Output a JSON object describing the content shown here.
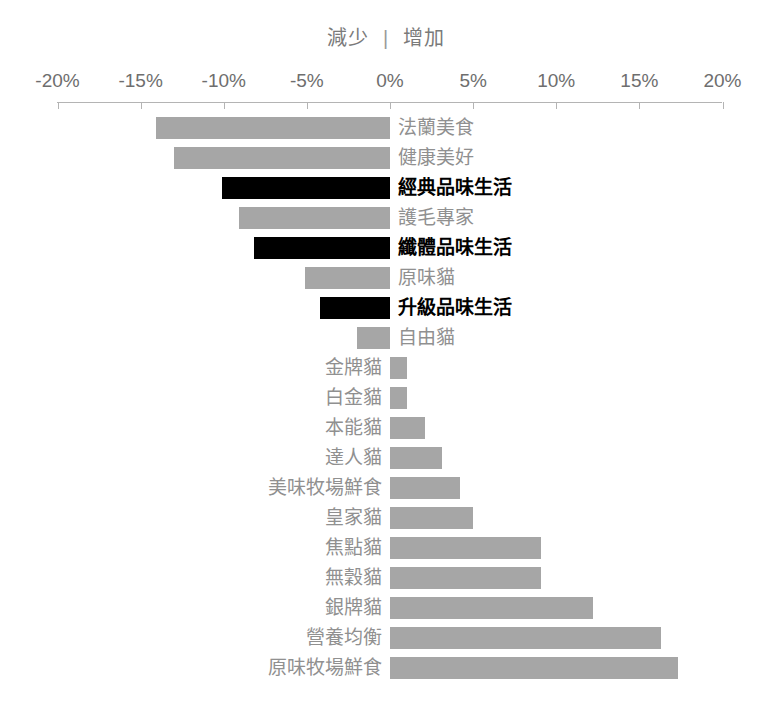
{
  "header": {
    "decrease_label": "減少",
    "separator": "|",
    "increase_label": "增加"
  },
  "axis": {
    "ticks": [
      "-20%",
      "-15%",
      "-10%",
      "-5%",
      "0%",
      "5%",
      "10%",
      "15%",
      "20%"
    ],
    "tick_values": [
      -20,
      -15,
      -10,
      -5,
      0,
      5,
      10,
      15,
      20
    ],
    "min": -20,
    "max": 20,
    "left_px": 57,
    "right_px": 722,
    "zero_px": 390
  },
  "colors": {
    "bar_default": "#a6a6a6",
    "bar_highlight": "#000000",
    "label_default": "#909090",
    "label_highlight": "#000000",
    "axis": "#b4b4b4"
  },
  "chart_data": {
    "type": "bar",
    "orientation": "horizontal",
    "title": "",
    "subtitle": "",
    "xlabel": "",
    "ylabel": "",
    "xlim": [
      -20,
      20
    ],
    "grid": false,
    "legend_position": "top-center",
    "legend_entries": [
      "減少",
      "增加"
    ],
    "annotations": [
      "減少 | 增加"
    ],
    "tick_labels": [
      "-20%",
      "-15%",
      "-10%",
      "-5%",
      "0%",
      "5%",
      "10%",
      "15%",
      "20%"
    ],
    "categories": [
      "法蘭美食",
      "健康美好",
      "經典品味生活",
      "護毛專家",
      "纖體品味生活",
      "原味貓",
      "升級品味生活",
      "自由貓",
      "金牌貓",
      "白金貓",
      "本能貓",
      "達人貓",
      "美味牧場鮮食",
      "皇家貓",
      "焦點貓",
      "無穀貓",
      "銀牌貓",
      "營養均衡",
      "原味牧場鮮食"
    ],
    "values": [
      -14.1,
      -13.0,
      -10.1,
      -9.1,
      -8.2,
      -5.1,
      -4.2,
      -2.0,
      1.0,
      1.0,
      2.1,
      3.1,
      4.2,
      5.0,
      9.1,
      9.1,
      12.2,
      16.3,
      17.3
    ],
    "highlighted": [
      false,
      false,
      true,
      false,
      true,
      false,
      true,
      false,
      false,
      false,
      false,
      false,
      false,
      false,
      false,
      false,
      false,
      false,
      false
    ]
  }
}
